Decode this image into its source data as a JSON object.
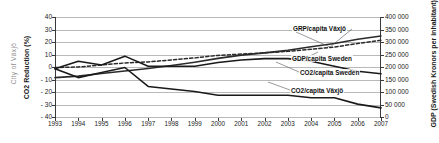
{
  "watermark": {
    "text": "City of Växjö"
  },
  "axes": {
    "left_title": "CO2 Reduction (%)",
    "right_title": "GDP (Swedish Kronors per inhabitant)",
    "left_ticks": [
      "40",
      "30",
      "20",
      "10",
      "0",
      "- 10",
      "- 20",
      "- 30",
      "- 40"
    ],
    "right_ticks": [
      "400 000",
      "350 000",
      "300 000",
      "250 000",
      "200 000",
      "150 000",
      "100 000",
      "50 000",
      "0"
    ],
    "x_ticks": [
      "1993",
      "1994",
      "1995",
      "1996",
      "1997",
      "1998",
      "1999",
      "2000",
      "2001",
      "2002",
      "2003",
      "2004",
      "2005",
      "2006",
      "2007"
    ]
  },
  "labels": {
    "grp_vaxjo": "GRP/capita Växjö",
    "gdp_sweden": "GDP/capita Sweden",
    "co2_sweden": "CO2/capita Sweden",
    "co2_vaxjo": "CO2/capita Växjö"
  },
  "chart_data": {
    "type": "line",
    "title": "",
    "xlabel": "",
    "ylabel": "CO2 Reduction (%)",
    "y2label": "GDP (Swedish Kronors per inhabitant)",
    "grid": true,
    "legend": "annotations-inline",
    "x": [
      1993,
      1994,
      1995,
      1996,
      1997,
      1998,
      1999,
      2000,
      2001,
      2002,
      2003,
      2004,
      2005,
      2006,
      2007
    ],
    "ylim": [
      -40,
      40
    ],
    "y2lim": [
      0,
      400000
    ],
    "yticks": [
      40,
      30,
      20,
      10,
      0,
      -10,
      -20,
      -30,
      -40
    ],
    "y2ticks": [
      400000,
      350000,
      300000,
      250000,
      200000,
      150000,
      100000,
      50000,
      0
    ],
    "series": [
      {
        "name": "GRP/capita Växjö",
        "axis": "right",
        "style": "solid",
        "color": "#2b2b2b",
        "values": [
          160000,
          166000,
          176000,
          186000,
          196000,
          208000,
          221000,
          236000,
          249000,
          258000,
          268000,
          282000,
          295000,
          312000,
          325000
        ]
      },
      {
        "name": "GDP/capita Sweden",
        "axis": "right",
        "style": "dashed",
        "color": "#2b2b2b",
        "values": [
          200000,
          202000,
          210000,
          218000,
          222000,
          230000,
          238000,
          248000,
          253000,
          258000,
          264000,
          272000,
          281000,
          295000,
          308000
        ]
      },
      {
        "name": "CO2/capita Sweden",
        "axis": "left",
        "style": "solid",
        "color": "#1a1a1a",
        "values": [
          -1,
          5,
          2,
          9,
          1,
          1,
          1,
          4,
          6,
          7,
          7,
          5,
          1,
          -3,
          -5
        ]
      },
      {
        "name": "CO2/capita Växjö",
        "axis": "left",
        "style": "solid",
        "color": "#1a1a1a",
        "values": [
          -1,
          -8,
          -4,
          0,
          -15,
          -17,
          -19,
          -22,
          -22,
          -22,
          -22,
          -24,
          -24,
          -29,
          -32
        ]
      }
    ]
  }
}
